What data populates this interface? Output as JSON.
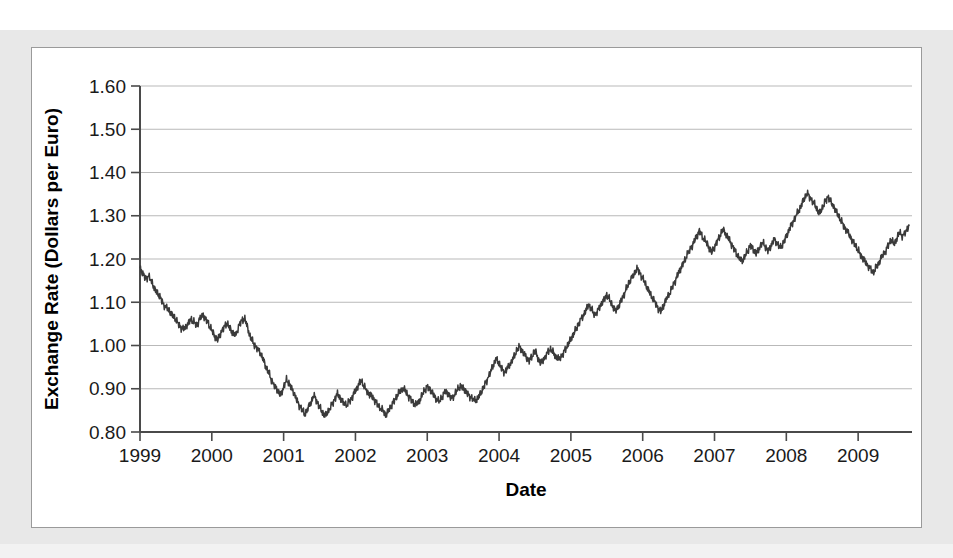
{
  "chart_data": {
    "type": "line",
    "title": "",
    "xlabel": "Date",
    "ylabel": "Exchange Rate (Dollars per Euro)",
    "xlim": [
      1999.0,
      2009.75
    ],
    "ylim": [
      0.8,
      1.6
    ],
    "grid": true,
    "legend": "none",
    "x_tick_labels": [
      "1999",
      "2000",
      "2001",
      "2002",
      "2003",
      "2004",
      "2005",
      "2006",
      "2007",
      "2008",
      "2009"
    ],
    "x_tick_values": [
      1999,
      2000,
      2001,
      2002,
      2003,
      2004,
      2005,
      2006,
      2007,
      2008,
      2009
    ],
    "y_tick_labels": [
      "0.80",
      "0.90",
      "1.00",
      "1.10",
      "1.20",
      "1.30",
      "1.40",
      "1.50",
      "1.60"
    ],
    "y_tick_values": [
      0.8,
      0.9,
      1.0,
      1.1,
      1.2,
      1.3,
      1.4,
      1.5,
      1.6
    ],
    "series": [
      {
        "name": "US Dollars per Euro",
        "color": "#3a3a3a",
        "x": [
          1999.0,
          1999.04,
          1999.08,
          1999.12,
          1999.17,
          1999.21,
          1999.25,
          1999.29,
          1999.33,
          1999.38,
          1999.42,
          1999.46,
          1999.5,
          1999.54,
          1999.58,
          1999.62,
          1999.67,
          1999.71,
          1999.75,
          1999.79,
          1999.83,
          1999.88,
          1999.92,
          1999.96,
          2000.0,
          2000.04,
          2000.08,
          2000.12,
          2000.17,
          2000.21,
          2000.25,
          2000.29,
          2000.33,
          2000.38,
          2000.42,
          2000.46,
          2000.5,
          2000.54,
          2000.58,
          2000.62,
          2000.67,
          2000.71,
          2000.75,
          2000.79,
          2000.83,
          2000.88,
          2000.92,
          2000.96,
          2001.0,
          2001.04,
          2001.08,
          2001.12,
          2001.17,
          2001.21,
          2001.25,
          2001.29,
          2001.33,
          2001.38,
          2001.42,
          2001.46,
          2001.5,
          2001.54,
          2001.58,
          2001.62,
          2001.67,
          2001.71,
          2001.75,
          2001.79,
          2001.83,
          2001.88,
          2001.92,
          2001.96,
          2002.0,
          2002.04,
          2002.08,
          2002.12,
          2002.17,
          2002.21,
          2002.25,
          2002.29,
          2002.33,
          2002.38,
          2002.42,
          2002.46,
          2002.5,
          2002.54,
          2002.58,
          2002.62,
          2002.67,
          2002.71,
          2002.75,
          2002.79,
          2002.83,
          2002.88,
          2002.92,
          2002.96,
          2003.0,
          2003.04,
          2003.08,
          2003.12,
          2003.17,
          2003.21,
          2003.25,
          2003.29,
          2003.33,
          2003.38,
          2003.42,
          2003.46,
          2003.5,
          2003.54,
          2003.58,
          2003.62,
          2003.67,
          2003.71,
          2003.75,
          2003.79,
          2003.83,
          2003.88,
          2003.92,
          2003.96,
          2004.0,
          2004.04,
          2004.08,
          2004.12,
          2004.17,
          2004.21,
          2004.25,
          2004.29,
          2004.33,
          2004.38,
          2004.42,
          2004.46,
          2004.5,
          2004.54,
          2004.58,
          2004.62,
          2004.67,
          2004.71,
          2004.75,
          2004.79,
          2004.83,
          2004.88,
          2004.92,
          2004.96,
          2005.0,
          2005.04,
          2005.08,
          2005.12,
          2005.17,
          2005.21,
          2005.25,
          2005.29,
          2005.33,
          2005.38,
          2005.42,
          2005.46,
          2005.5,
          2005.54,
          2005.58,
          2005.62,
          2005.67,
          2005.71,
          2005.75,
          2005.79,
          2005.83,
          2005.88,
          2005.92,
          2005.96,
          2006.0,
          2006.04,
          2006.08,
          2006.12,
          2006.17,
          2006.21,
          2006.25,
          2006.29,
          2006.33,
          2006.38,
          2006.42,
          2006.46,
          2006.5,
          2006.54,
          2006.58,
          2006.62,
          2006.67,
          2006.71,
          2006.75,
          2006.79,
          2006.83,
          2006.88,
          2006.92,
          2006.96,
          2007.0,
          2007.04,
          2007.08,
          2007.12,
          2007.17,
          2007.21,
          2007.25,
          2007.29,
          2007.33,
          2007.38,
          2007.42,
          2007.46,
          2007.5,
          2007.54,
          2007.58,
          2007.62,
          2007.67,
          2007.71,
          2007.75,
          2007.79,
          2007.83,
          2007.88,
          2007.92,
          2007.96,
          2008.0,
          2008.04,
          2008.08,
          2008.12,
          2008.17,
          2008.21,
          2008.25,
          2008.29,
          2008.33,
          2008.38,
          2008.42,
          2008.46,
          2008.5,
          2008.54,
          2008.58,
          2008.62,
          2008.67,
          2008.71,
          2008.75,
          2008.79,
          2008.83,
          2008.88,
          2008.92,
          2008.96,
          2009.0,
          2009.04,
          2009.08,
          2009.12,
          2009.17,
          2009.21,
          2009.25,
          2009.29,
          2009.33,
          2009.38,
          2009.42,
          2009.46,
          2009.5,
          2009.54,
          2009.58,
          2009.62,
          2009.67,
          2009.71
        ],
        "y": [
          1.18,
          1.165,
          1.155,
          1.16,
          1.145,
          1.128,
          1.12,
          1.108,
          1.095,
          1.085,
          1.078,
          1.068,
          1.06,
          1.048,
          1.04,
          1.038,
          1.052,
          1.06,
          1.055,
          1.045,
          1.062,
          1.07,
          1.06,
          1.048,
          1.035,
          1.022,
          1.012,
          1.028,
          1.042,
          1.052,
          1.04,
          1.03,
          1.022,
          1.048,
          1.058,
          1.062,
          1.04,
          1.018,
          1.005,
          0.995,
          0.985,
          0.97,
          0.952,
          0.938,
          0.92,
          0.905,
          0.895,
          0.885,
          0.905,
          0.92,
          0.912,
          0.898,
          0.88,
          0.862,
          0.855,
          0.84,
          0.852,
          0.868,
          0.885,
          0.872,
          0.858,
          0.845,
          0.838,
          0.848,
          0.862,
          0.876,
          0.888,
          0.878,
          0.868,
          0.862,
          0.872,
          0.882,
          0.895,
          0.908,
          0.92,
          0.905,
          0.892,
          0.885,
          0.878,
          0.868,
          0.858,
          0.85,
          0.84,
          0.848,
          0.862,
          0.872,
          0.884,
          0.894,
          0.902,
          0.89,
          0.88,
          0.872,
          0.862,
          0.87,
          0.882,
          0.896,
          0.905,
          0.898,
          0.888,
          0.878,
          0.87,
          0.882,
          0.895,
          0.888,
          0.878,
          0.886,
          0.898,
          0.906,
          0.902,
          0.892,
          0.885,
          0.878,
          0.872,
          0.88,
          0.892,
          0.905,
          0.92,
          0.938,
          0.955,
          0.97,
          0.958,
          0.945,
          0.938,
          0.948,
          0.962,
          0.975,
          0.99,
          0.998,
          0.985,
          0.972,
          0.965,
          0.975,
          0.988,
          0.972,
          0.958,
          0.968,
          0.982,
          0.992,
          0.985,
          0.975,
          0.968,
          0.978,
          0.99,
          1.002,
          1.015,
          1.028,
          1.04,
          1.055,
          1.068,
          1.082,
          1.095,
          1.082,
          1.07,
          1.082,
          1.095,
          1.105,
          1.118,
          1.105,
          1.092,
          1.08,
          1.092,
          1.108,
          1.122,
          1.138,
          1.152,
          1.165,
          1.178,
          1.168,
          1.155,
          1.142,
          1.128,
          1.115,
          1.1,
          1.088,
          1.078,
          1.092,
          1.108,
          1.122,
          1.138,
          1.152,
          1.168,
          1.182,
          1.195,
          1.21,
          1.225,
          1.238,
          1.252,
          1.265,
          1.252,
          1.24,
          1.228,
          1.215,
          1.228,
          1.242,
          1.255,
          1.268,
          1.255,
          1.242,
          1.23,
          1.218,
          1.205,
          1.195,
          1.205,
          1.218,
          1.232,
          1.222,
          1.212,
          1.225,
          1.238,
          1.228,
          1.218,
          1.232,
          1.245,
          1.235,
          1.225,
          1.238,
          1.252,
          1.268,
          1.282,
          1.295,
          1.31,
          1.325,
          1.34,
          1.352,
          1.342,
          1.33,
          1.318,
          1.305,
          1.318,
          1.332,
          1.345,
          1.332,
          1.318,
          1.305,
          1.292,
          1.28,
          1.268,
          1.255,
          1.242,
          1.232,
          1.22,
          1.208,
          1.198,
          1.188,
          1.178,
          1.168,
          1.18,
          1.192,
          1.205,
          1.218,
          1.232,
          1.245,
          1.235,
          1.248,
          1.262,
          1.252,
          1.265,
          1.278
        ]
      }
    ],
    "notes": {
      "start_value": 1.18,
      "start_date": "1999",
      "minimum_value": 0.83,
      "minimum_date": "late 2000 / mid 2001",
      "maximum_value": 1.59,
      "maximum_date": "mid 2008",
      "end_value": 1.41,
      "end_date": "late 2009"
    }
  },
  "axis": {
    "ylabel": "Exchange Rate (Dollars per Euro)",
    "xlabel": "Date"
  }
}
